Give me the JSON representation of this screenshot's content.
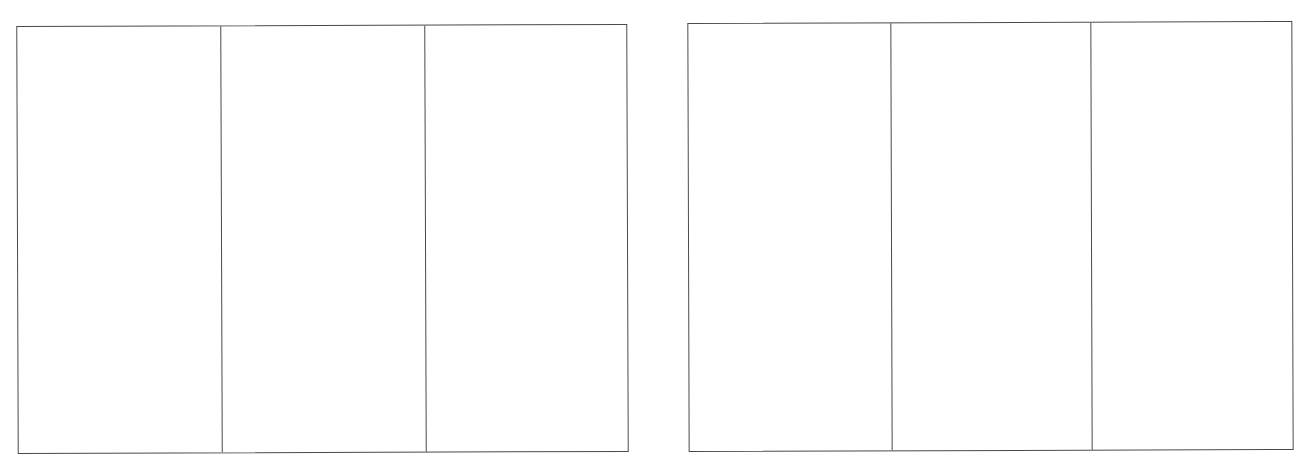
{
  "document": {
    "type": "tri-fold layout template",
    "line_color": "#4a4a4a",
    "background_color": "#ffffff"
  },
  "panels": [
    {
      "name": "left-panel",
      "columns": [
        {
          "content": ""
        },
        {
          "content": ""
        },
        {
          "content": ""
        }
      ]
    },
    {
      "name": "right-panel",
      "columns": [
        {
          "content": ""
        },
        {
          "content": ""
        },
        {
          "content": ""
        }
      ]
    }
  ]
}
